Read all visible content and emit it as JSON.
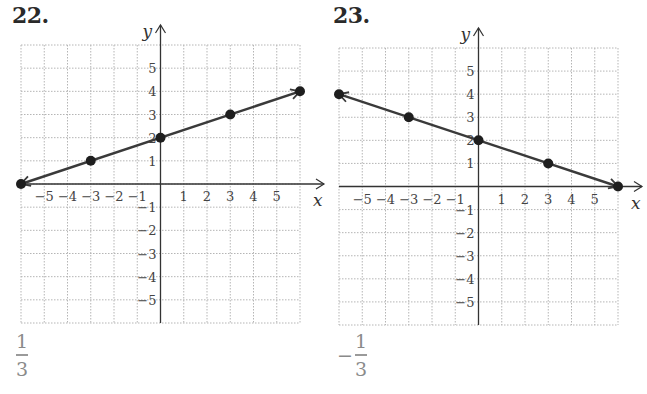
{
  "chart_data": [
    {
      "type": "line",
      "label": "22.",
      "xlabel": "x",
      "ylabel": "y",
      "xlim": [
        -6,
        6
      ],
      "ylim": [
        -6,
        6
      ],
      "x_ticks": [
        -5,
        -4,
        -3,
        -2,
        -1,
        1,
        2,
        3,
        4,
        5
      ],
      "y_ticks": [
        -5,
        -4,
        -3,
        -2,
        -1,
        1,
        2,
        3,
        4,
        5
      ],
      "grid": true,
      "points": [
        {
          "x": -6,
          "y": 0
        },
        {
          "x": -3,
          "y": 1
        },
        {
          "x": 0,
          "y": 2
        },
        {
          "x": 3,
          "y": 3
        },
        {
          "x": 6,
          "y": 4
        }
      ],
      "slope": "1/3",
      "answer": {
        "sign": "",
        "numerator": "1",
        "denominator": "3"
      }
    },
    {
      "type": "line",
      "label": "23.",
      "xlabel": "x",
      "ylabel": "y",
      "xlim": [
        -6,
        6
      ],
      "ylim": [
        -6,
        6
      ],
      "x_ticks": [
        -5,
        -4,
        -3,
        -2,
        -1,
        1,
        2,
        3,
        4,
        5
      ],
      "y_ticks": [
        -5,
        -4,
        -3,
        -2,
        -1,
        1,
        2,
        3,
        4,
        5
      ],
      "grid": true,
      "points": [
        {
          "x": -6,
          "y": 4
        },
        {
          "x": -3,
          "y": 3
        },
        {
          "x": 0,
          "y": 2
        },
        {
          "x": 3,
          "y": 1
        },
        {
          "x": 6,
          "y": 0
        }
      ],
      "slope": "-1/3",
      "answer": {
        "sign": "−",
        "numerator": "1",
        "denominator": "3"
      }
    }
  ],
  "colors": {
    "grid": "#b5b5b5",
    "axis": "#333333",
    "line": "#3a3a3a",
    "answer": "#8a8a8a"
  }
}
